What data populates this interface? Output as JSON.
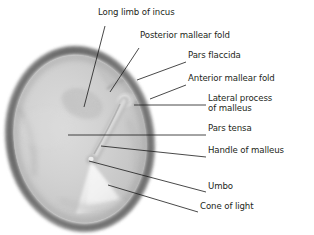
{
  "figure": {
    "type": "labeled-anatomical-illustration",
    "canvas": {
      "width": 314,
      "height": 235,
      "background": "#ffffff"
    },
    "colors": {
      "drum_interior": "#cfcfcf",
      "drum_interior_light": "#e2e2e2",
      "annulus_ring": "#8a8a8a",
      "annulus_ring_dark": "#6d6d6d",
      "halo": "#f0f0f0",
      "cone_of_light": "#ececec",
      "malleus": "#bdbdbd",
      "leader_line": "#1a1a1a",
      "label_text": "#231f20"
    },
    "drum": {
      "center_x": 80,
      "center_y": 139,
      "radius_x": 70,
      "radius_y": 89,
      "rotation_deg": -8
    }
  },
  "labels": [
    {
      "id": "long-limb-of-incus",
      "text": "Long limb of incus",
      "line1": "Long limb of incus",
      "line2": "",
      "text_x": 98,
      "text_y": 14,
      "anchor": "left",
      "leader": {
        "x1": 105,
        "y1": 26,
        "x2": 84,
        "y2": 107
      }
    },
    {
      "id": "posterior-mallear-fold",
      "text": "Posterior mallear fold",
      "line1": "Posterior mallear fold",
      "line2": "",
      "text_x": 140,
      "text_y": 37,
      "anchor": "left",
      "leader": {
        "x1": 139,
        "y1": 48,
        "x2": 110,
        "y2": 92
      }
    },
    {
      "id": "pars-flaccida",
      "text": "Pars flaccida",
      "line1": "Pars flaccida",
      "line2": "",
      "text_x": 188,
      "text_y": 57,
      "anchor": "left",
      "leader": {
        "x1": 186,
        "y1": 62,
        "x2": 137,
        "y2": 80
      }
    },
    {
      "id": "anterior-mallear-fold",
      "text": "Anterior mallear fold",
      "line1": "Anterior mallear fold",
      "line2": "",
      "text_x": 188,
      "text_y": 80,
      "anchor": "left",
      "leader": {
        "x1": 186,
        "y1": 85,
        "x2": 150,
        "y2": 99
      }
    },
    {
      "id": "lateral-process-of-malleus",
      "text": "Lateral process of malleus",
      "line1": "Lateral process",
      "line2": "of malleus",
      "text_x": 208,
      "text_y": 100,
      "anchor": "left",
      "leader": {
        "x1": 206,
        "y1": 105,
        "x2": 134,
        "y2": 105
      }
    },
    {
      "id": "pars-tensa",
      "text": "Pars tensa",
      "line1": "Pars tensa",
      "line2": "",
      "text_x": 208,
      "text_y": 130,
      "anchor": "left",
      "leader": {
        "x1": 206,
        "y1": 135,
        "x2": 68,
        "y2": 135
      }
    },
    {
      "id": "handle-of-malleus",
      "text": "Handle of malleus",
      "line1": "Handle of malleus",
      "line2": "",
      "text_x": 208,
      "text_y": 152,
      "anchor": "left",
      "leader": {
        "x1": 206,
        "y1": 157,
        "x2": 101,
        "y2": 146
      }
    },
    {
      "id": "umbo",
      "text": "Umbo",
      "line1": "Umbo",
      "line2": "",
      "text_x": 208,
      "text_y": 188,
      "anchor": "left",
      "leader": {
        "x1": 206,
        "y1": 192,
        "x2": 89,
        "y2": 161
      }
    },
    {
      "id": "cone-of-light",
      "text": "Cone of light",
      "line1": "Cone of light",
      "line2": "",
      "text_x": 200,
      "text_y": 208,
      "anchor": "left",
      "leader": {
        "x1": 198,
        "y1": 212,
        "x2": 108,
        "y2": 185
      }
    }
  ],
  "structures": [
    {
      "id": "annulus",
      "name": "Fibrous annulus ring"
    },
    {
      "id": "pars-tensa-region",
      "name": "Pars tensa"
    },
    {
      "id": "pars-flaccida-region",
      "name": "Pars flaccida"
    },
    {
      "id": "malleus-handle",
      "name": "Handle of malleus"
    },
    {
      "id": "lateral-process",
      "name": "Lateral process of malleus"
    },
    {
      "id": "umbo-point",
      "name": "Umbo"
    },
    {
      "id": "cone-of-light-region",
      "name": "Cone of light"
    },
    {
      "id": "incus-shadow",
      "name": "Long limb of incus (shadow)"
    }
  ]
}
